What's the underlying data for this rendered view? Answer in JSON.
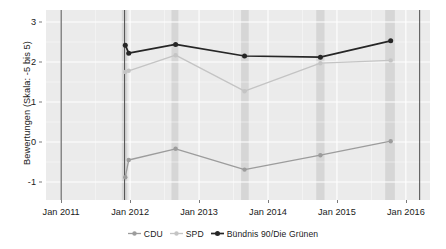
{
  "chart_data": {
    "type": "line",
    "title": "",
    "subtitle": "",
    "xlabel": "",
    "ylabel": "Bewertungen (Skala: -5 bis 5)",
    "x_tick_labels": [
      "Jan 2011",
      "Jan 2012",
      "Jan 2013",
      "Jan 2014",
      "Jan 2015",
      "Jan 2016"
    ],
    "x_tick_values": [
      2011.0,
      2012.0,
      2013.0,
      2014.0,
      2015.0,
      2016.0
    ],
    "y_tick_labels": [
      "3",
      "2",
      "1",
      "0",
      "-1"
    ],
    "y_tick_values": [
      3,
      2,
      1,
      0,
      -1
    ],
    "xlim": [
      2010.78,
      2016.35
    ],
    "ylim": [
      -1.45,
      3.3
    ],
    "grid": true,
    "legend_position": "bottom",
    "panel_background": "#ebebeb",
    "grid_color": "#ffffff",
    "shaded_band_color": "#d6d6d6",
    "shaded_bands": [
      {
        "start": 2011.88,
        "end": 2011.96
      },
      {
        "start": 2012.6,
        "end": 2012.7
      },
      {
        "start": 2013.61,
        "end": 2013.72
      },
      {
        "start": 2014.7,
        "end": 2014.82
      },
      {
        "start": 2015.7,
        "end": 2015.84
      }
    ],
    "vertical_rules": [
      2011.0,
      2011.92,
      2016.2
    ],
    "vertical_rule_color": "#4d4d4d",
    "x": [
      2011.93,
      2011.98,
      2012.66,
      2013.66,
      2014.76,
      2015.78
    ],
    "series": [
      {
        "name": "CDU",
        "color": "#9c9c9c",
        "values": [
          -0.88,
          -0.45,
          -0.17,
          -0.69,
          -0.33,
          0.02
        ]
      },
      {
        "name": "SPD",
        "color": "#c4c4c4",
        "values": [
          1.75,
          1.78,
          2.17,
          1.27,
          1.97,
          2.04
        ]
      },
      {
        "name": "Bündnis 90/Die Grünen",
        "color": "#262626",
        "values": [
          2.42,
          2.22,
          2.44,
          2.15,
          2.12,
          2.53
        ]
      }
    ]
  },
  "legend": {
    "items": [
      {
        "label": "CDU",
        "color": "#9c9c9c"
      },
      {
        "label": "SPD",
        "color": "#c4c4c4"
      },
      {
        "label": "Bündnis 90/Die Grünen",
        "color": "#262626"
      }
    ]
  },
  "axis": {
    "y_title": "Bewertungen (Skala: -5 bis 5)"
  }
}
